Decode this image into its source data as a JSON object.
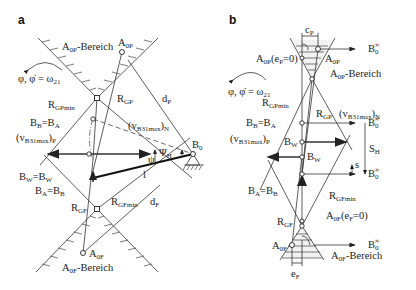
{
  "panels": [
    {
      "id": "a",
      "label": "a",
      "labels": {
        "a0p_region": "A",
        "a0p_region_sub": "0P",
        "a0p_region_suffix": "-Bereich",
        "a0p": "A",
        "a0p_sub": "0P",
        "phi": "φ, φ̇ = ω",
        "phi_sub": "21",
        "rgpmin": "R",
        "rgpmin_sub": "GPmin",
        "rgp": "R",
        "rgp_sub": "GP",
        "dp": "d",
        "dp_sub": "P",
        "bb_ba": "B",
        "bb_sub": "B",
        "bb_eq": "=B",
        "ba_sub": "A",
        "vn": "(v",
        "vn_sub": "B31max",
        "vn_tail": ")",
        "vn_tail_sub": "N",
        "vp": "(v",
        "vp_sub": "B31max",
        "vp_tail": ")",
        "vp_tail_sub": "P",
        "b0": "B",
        "b0_sub": "0",
        "psi": "ψ",
        "psi_h": "Ψ",
        "psi_h_sub": "H",
        "l": "l",
        "bw": "B",
        "bw_sub": "W",
        "bw_eq": "=B",
        "bw2_sub": "W",
        "ba": "B",
        "ba_sub2": "A",
        "ba_eq": "=B",
        "bbbar_sub": "B",
        "rgfmin": "R",
        "rgfmin_sub": "GFmin",
        "df": "d",
        "df_sub": "F",
        "rgf": "R",
        "rgf_sub": "GF",
        "a0f": "A",
        "a0f_sub": "0F",
        "a0f_region": "A",
        "a0f_region_sub": "0F",
        "a0f_region_suffix": "-Bereich"
      }
    },
    {
      "id": "b",
      "label": "b",
      "labels": {
        "cp": "c",
        "cp_sub": "P",
        "b0inf": "B",
        "b0inf_sub": "0",
        "b0inf_sup": "∞",
        "a0p_ep": "A",
        "a0p_ep_sub": "0P",
        "a0p_ep_tail": "(e",
        "a0p_ep_tail_sub": "P",
        "a0p_ep_end": "=0)",
        "a0p": "A",
        "a0p_sub": "0P",
        "a0p_region": "A",
        "a0p_region_sub": "0P",
        "a0p_region_suffix": "-Bereich",
        "phi": "φ, φ̇ = ω",
        "phi_sub": "21",
        "rgpmin": "R",
        "rgpmin_sub": "GPmin",
        "rgp": "R",
        "rgp_sub": "GP",
        "vn": "(v",
        "vn_sub": "B31max",
        "vn_tail": ")",
        "vn_tail_sub": "N",
        "bb": "B",
        "bb_sub": "B",
        "bb_eq": "=B",
        "ba_sub": "A",
        "vp": "(v",
        "vp_sub": "B31max",
        "vp_tail": ")",
        "vp_tail_sub": "P",
        "bwbar": "B",
        "bwbar_sub": "W",
        "bw": "B",
        "bw_sub": "W",
        "sh": "S",
        "sh_sub": "H",
        "s": "s",
        "ba2": "B",
        "ba2_sub": "A",
        "ba2_eq": "=B",
        "bbbar_sub": "B",
        "rgfmin": "R",
        "rgfmin_sub": "GFmin",
        "a0f_ef": "A",
        "a0f_ef_sub": "0F",
        "a0f_ef_tail": "(e",
        "a0f_ef_tail_sub": "F",
        "a0f_ef_end": "=0)",
        "rgf": "R",
        "rgf_sub": "GF",
        "a0f": "A",
        "a0f_sub": "0F",
        "a0f_region": "A",
        "a0f_region_sub": "0F",
        "a0f_region_suffix": "-Bereich",
        "ef": "e",
        "ef_sub": "F"
      }
    }
  ]
}
